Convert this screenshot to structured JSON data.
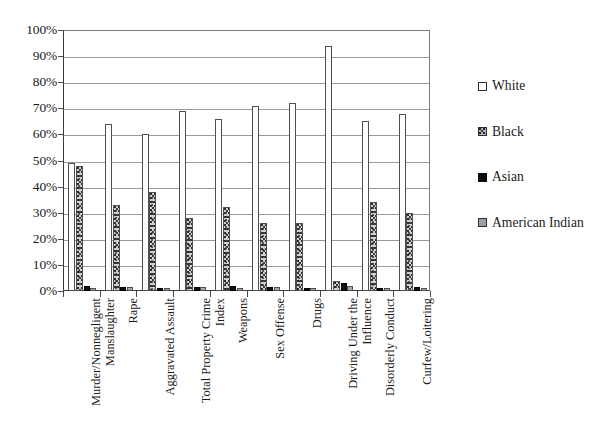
{
  "chart_data": {
    "type": "bar",
    "title": "",
    "subtitle": "",
    "xlabel": "",
    "ylabel": "",
    "ylim": [
      0,
      100
    ],
    "ytick_labels": [
      "0%",
      "10%",
      "20%",
      "30%",
      "40%",
      "50%",
      "60%",
      "70%",
      "80%",
      "90%",
      "100%"
    ],
    "ytick_values": [
      0,
      10,
      20,
      30,
      40,
      50,
      60,
      70,
      80,
      90,
      100
    ],
    "grid": true,
    "legend_position": "right",
    "orientation": "vertical-grouped",
    "xtick_label_rotation": 90,
    "categories": [
      "Murder/Nonnegligent Manslaughter",
      "Rape",
      "Aggravated Assault",
      "Total Property Crime Index",
      "Weapons",
      "Sex Offense",
      "Drugs",
      "Driving Under the Influence",
      "Disorderly Conduct",
      "Curfew/Loitering"
    ],
    "category_lines": [
      [
        "Murder/Nonnegligent",
        "Manslaughter"
      ],
      [
        "Rape"
      ],
      [
        "Aggravated Assault"
      ],
      [
        "Total Property Crime",
        "Index"
      ],
      [
        "Weapons"
      ],
      [
        "Sex Offense"
      ],
      [
        "Drugs"
      ],
      [
        "Driving Under the",
        "Influence"
      ],
      [
        "Disorderly Conduct"
      ],
      [
        "Curfew/Loitering"
      ]
    ],
    "series": [
      {
        "name": "White",
        "swatch": "white",
        "color": "#ffffff",
        "values": [
          49,
          64,
          60,
          69,
          66,
          71,
          72,
          94,
          65,
          68
        ]
      },
      {
        "name": "Black",
        "swatch": "black",
        "color": "#c8c8c8",
        "values": [
          48,
          33,
          38,
          28,
          32,
          26,
          26,
          4,
          34,
          30
        ]
      },
      {
        "name": "Asian",
        "swatch": "asian",
        "color": "#111111",
        "values": [
          2,
          1.5,
          1,
          1.5,
          2,
          1.5,
          1,
          3,
          1,
          1.5
        ]
      },
      {
        "name": "American Indian",
        "swatch": "amind",
        "color": "#a8a8a8",
        "values": [
          1,
          1.5,
          1,
          1.5,
          1,
          1.5,
          1,
          2,
          1,
          1
        ]
      }
    ]
  },
  "legend": {
    "items": [
      {
        "label": "White",
        "swatch": "white"
      },
      {
        "label": "Black",
        "swatch": "black"
      },
      {
        "label": "Asian",
        "swatch": "asian"
      },
      {
        "label": "American Indian",
        "swatch": "amind"
      }
    ]
  }
}
